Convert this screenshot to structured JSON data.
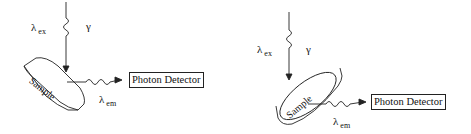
{
  "diagrams": [
    {
      "id": "left",
      "excitation": {
        "symbol": "λ",
        "subscript": "ex",
        "photon_symbol": "γ"
      },
      "sample_label": "Sample",
      "emission": {
        "symbol": "λ",
        "subscript": "em"
      },
      "detector_label": "Photon Detector"
    },
    {
      "id": "right",
      "excitation": {
        "symbol": "λ",
        "subscript": "ex",
        "photon_symbol": "γ"
      },
      "sample_label": "Sample",
      "emission": {
        "symbol": "λ",
        "subscript": "em"
      },
      "detector_label": "Photon Detector"
    }
  ],
  "colors": {
    "stroke": "#222222",
    "background": "#ffffff"
  }
}
